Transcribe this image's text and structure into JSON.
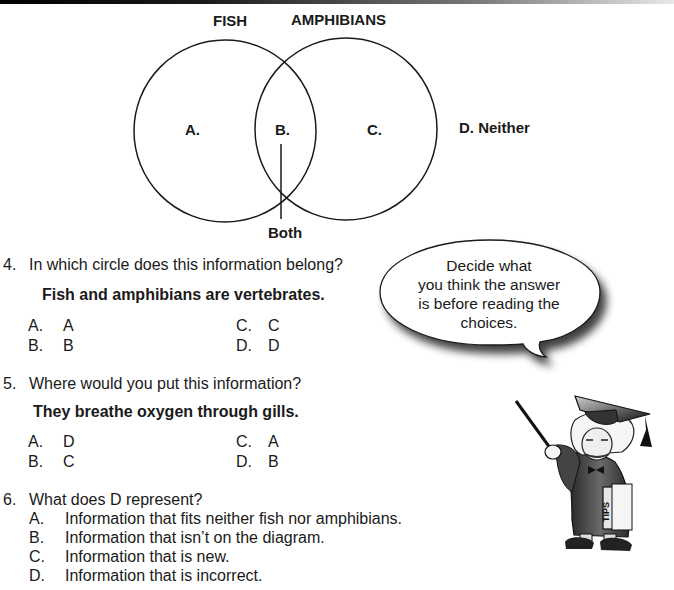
{
  "diagram": {
    "circle_labels": {
      "left": "FISH",
      "right": "AMPHIBIANS"
    },
    "regions": {
      "a": "A.",
      "b": "B.",
      "c": "C.",
      "d": "D. Neither"
    },
    "pointer_label": "Both"
  },
  "questions": [
    {
      "number": "4.",
      "text": "In which circle does this information belong?",
      "statement": "Fish and amphibians are vertebrates.",
      "choices": [
        {
          "letter": "A.",
          "value": "A"
        },
        {
          "letter": "B.",
          "value": "B"
        },
        {
          "letter": "C.",
          "value": "C"
        },
        {
          "letter": "D.",
          "value": "D"
        }
      ]
    },
    {
      "number": "5.",
      "text": "Where would you put this information?",
      "statement": "They breathe oxygen through gills.",
      "choices": [
        {
          "letter": "A.",
          "value": "D"
        },
        {
          "letter": "B.",
          "value": "C"
        },
        {
          "letter": "C.",
          "value": "A"
        },
        {
          "letter": "D.",
          "value": "B"
        }
      ]
    },
    {
      "number": "6.",
      "text": "What does D represent?",
      "choices": [
        {
          "letter": "A.",
          "value": "Information that fits neither fish nor amphibians."
        },
        {
          "letter": "B.",
          "value": "Information that isn’t on the diagram."
        },
        {
          "letter": "C.",
          "value": "Information that is new."
        },
        {
          "letter": "D.",
          "value": "Information that is incorrect."
        }
      ]
    }
  ],
  "tip_bubble": {
    "lines": [
      "Decide what",
      "you think the answer",
      "is before reading the",
      "choices."
    ]
  },
  "mascot": {
    "book_label": "TIPS"
  }
}
